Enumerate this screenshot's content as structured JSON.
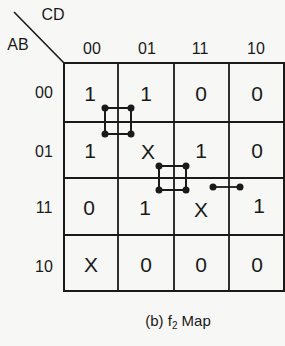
{
  "map": {
    "row_var_label": "AB",
    "col_var_label": "CD",
    "col_headers": [
      "00",
      "01",
      "11",
      "10"
    ],
    "row_headers": [
      "00",
      "01",
      "11",
      "10"
    ],
    "cells": [
      [
        "1",
        "1",
        "0",
        "0"
      ],
      [
        "1",
        "X",
        "1",
        "0"
      ],
      [
        "0",
        "1",
        "X",
        "1"
      ],
      [
        "X",
        "0",
        "0",
        "0"
      ]
    ],
    "connectors": [
      {
        "type": "square",
        "between": "AB00/AB01 x CD00/CD01"
      },
      {
        "type": "square",
        "between": "AB01/AB11 x CD01/CD11"
      },
      {
        "type": "bar",
        "between": "AB11: CD11-CD10"
      }
    ]
  },
  "caption": {
    "prefix": "(b) f",
    "subscript": "2",
    "suffix": " Map"
  },
  "colors": {
    "ink": "#1a1a1a",
    "background": "#f7f7f5"
  }
}
